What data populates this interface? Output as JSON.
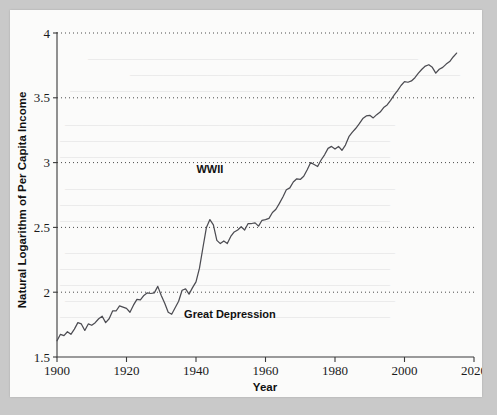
{
  "figure": {
    "background_color": "#fbfbfa",
    "page_border_color": "#c9c9c9",
    "line_color": "#4c4c52",
    "grid_color": "#4a4a4a"
  },
  "chart_data": {
    "type": "line",
    "title": "",
    "xlabel": "Year",
    "ylabel": "Natural Logarithm of Per Capita Income",
    "xlim": [
      1900,
      2020
    ],
    "ylim": [
      1.5,
      4
    ],
    "xticks": [
      1900,
      1920,
      1940,
      1960,
      1980,
      2000,
      2020
    ],
    "xtick_labels": [
      "1900",
      "1920",
      "1940",
      "1960",
      "1980",
      "2000",
      "2020"
    ],
    "yticks": [
      1.5,
      2,
      2.5,
      3,
      3.5,
      4
    ],
    "ytick_labels": [
      "1.5",
      "2",
      "2.5",
      "3",
      "3.5",
      "4"
    ],
    "grid": "horizontal-dotted",
    "legend": "none",
    "annotations": [
      {
        "label": "WWII",
        "x": 1944,
        "y": 2.86,
        "anchor": "middle"
      },
      {
        "label": "Great Depression",
        "x": 1936,
        "y": 1.83,
        "anchor": "start"
      }
    ],
    "series": [
      {
        "name": "Natural Logarithm of Per Capita Income",
        "x": [
          1900,
          1901,
          1902,
          1903,
          1904,
          1905,
          1906,
          1907,
          1908,
          1909,
          1910,
          1911,
          1912,
          1913,
          1914,
          1915,
          1916,
          1917,
          1918,
          1919,
          1920,
          1921,
          1922,
          1923,
          1924,
          1925,
          1926,
          1927,
          1928,
          1929,
          1930,
          1931,
          1932,
          1933,
          1934,
          1935,
          1936,
          1937,
          1938,
          1939,
          1940,
          1941,
          1942,
          1943,
          1944,
          1945,
          1946,
          1947,
          1948,
          1949,
          1950,
          1951,
          1952,
          1953,
          1954,
          1955,
          1956,
          1957,
          1958,
          1959,
          1960,
          1961,
          1962,
          1963,
          1964,
          1965,
          1966,
          1967,
          1968,
          1969,
          1970,
          1971,
          1972,
          1973,
          1974,
          1975,
          1976,
          1977,
          1978,
          1979,
          1980,
          1981,
          1982,
          1983,
          1984,
          1985,
          1986,
          1987,
          1988,
          1989,
          1990,
          1991,
          1992,
          1993,
          1994,
          1995,
          1996,
          1997,
          1998,
          1999,
          2000,
          2001,
          2002,
          2003,
          2004,
          2005,
          2006,
          2007,
          2008,
          2009,
          2010,
          2011,
          2012,
          2013,
          2014,
          2015
        ],
        "values": [
          1.625,
          1.675,
          1.665,
          1.695,
          1.675,
          1.715,
          1.765,
          1.755,
          1.705,
          1.755,
          1.745,
          1.765,
          1.795,
          1.815,
          1.765,
          1.795,
          1.855,
          1.855,
          1.895,
          1.885,
          1.875,
          1.845,
          1.9,
          1.945,
          1.94,
          1.975,
          1.995,
          1.99,
          1.995,
          2.045,
          1.975,
          1.915,
          1.845,
          1.83,
          1.88,
          1.93,
          2.015,
          2.025,
          1.985,
          2.035,
          2.08,
          2.185,
          2.345,
          2.5,
          2.56,
          2.52,
          2.4,
          2.375,
          2.395,
          2.375,
          2.43,
          2.465,
          2.48,
          2.505,
          2.48,
          2.53,
          2.53,
          2.535,
          2.51,
          2.555,
          2.56,
          2.57,
          2.615,
          2.64,
          2.685,
          2.735,
          2.79,
          2.805,
          2.85,
          2.875,
          2.87,
          2.895,
          2.945,
          3.0,
          2.985,
          2.97,
          3.02,
          3.06,
          3.11,
          3.125,
          3.105,
          3.125,
          3.095,
          3.135,
          3.2,
          3.235,
          3.265,
          3.3,
          3.34,
          3.36,
          3.365,
          3.345,
          3.37,
          3.39,
          3.425,
          3.445,
          3.48,
          3.52,
          3.555,
          3.595,
          3.625,
          3.62,
          3.63,
          3.655,
          3.69,
          3.72,
          3.745,
          3.755,
          3.735,
          3.69,
          3.72,
          3.735,
          3.76,
          3.78,
          3.815,
          3.845
        ]
      }
    ]
  }
}
